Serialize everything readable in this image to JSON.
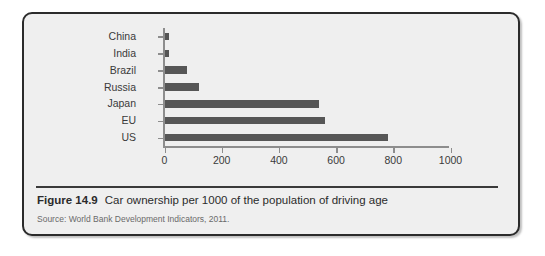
{
  "caption": {
    "figure_number": "Figure 14.9",
    "title": "Car ownership per 1000 of the population of driving age",
    "source": "Source: World Bank Development Indicators, 2011."
  },
  "colors": {
    "bar": "#565656",
    "axis": "#8d8d8d",
    "panel_background": "#efefef",
    "panel_border": "#2b2b2b",
    "caption_text": "#2b2b2b",
    "source_text": "#6a6a6a"
  },
  "chart_data": {
    "type": "bar",
    "orientation": "horizontal",
    "title": "Car ownership per 1000 of the population of driving age",
    "xlabel": "",
    "ylabel": "",
    "categories": [
      "China",
      "India",
      "Brazil",
      "Russia",
      "Japan",
      "EU",
      "US"
    ],
    "values": [
      15,
      15,
      80,
      120,
      540,
      560,
      780
    ],
    "xlim": [
      0,
      1000
    ],
    "xticks": [
      0,
      200,
      400,
      600,
      800,
      1000
    ],
    "xtick_labels": [
      "0",
      "200",
      "400",
      "600",
      "800",
      "1000"
    ],
    "grid": false,
    "legend": null,
    "series": [
      {
        "name": "Car ownership per 1000",
        "values": [
          15,
          15,
          80,
          120,
          540,
          560,
          780
        ]
      }
    ]
  }
}
